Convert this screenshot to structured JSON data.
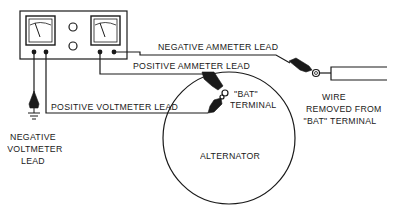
{
  "diagram": {
    "type": "wiring-diagram",
    "labels": {
      "negative_ammeter_lead": "NEGATIVE AMMETER LEAD",
      "positive_ammeter_lead": "POSITIVE AMMETER LEAD",
      "positive_voltmeter_lead": "POSITIVE VOLTMETER LEAD",
      "bat_terminal_line1": "\"BAT\"",
      "bat_terminal_line2": "TERMINAL",
      "wire_removed_line1": "WIRE",
      "wire_removed_line2": "REMOVED FROM",
      "wire_removed_line3": "\"BAT\" TERMINAL",
      "negative_voltmeter_line1": "NEGATIVE",
      "negative_voltmeter_line2": "VOLTMETER",
      "negative_voltmeter_line3": "LEAD",
      "alternator": "ALTERNATOR"
    },
    "components": [
      {
        "id": "voltmeter",
        "icon": "analog-meter-icon"
      },
      {
        "id": "ammeter",
        "icon": "analog-meter-icon"
      },
      {
        "id": "alternator",
        "icon": "circle-housing"
      },
      {
        "id": "ground",
        "icon": "ground-symbol-icon"
      }
    ],
    "colors": {
      "ink": "#1a1a1a",
      "background": "#ffffff"
    }
  }
}
